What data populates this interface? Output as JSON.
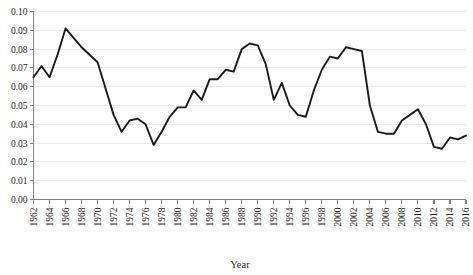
{
  "chart_data": {
    "type": "line",
    "title": "",
    "subtitle": "",
    "xlabel": "Year",
    "ylabel": "",
    "xlim": [
      1962,
      2016
    ],
    "ylim": [
      0.0,
      0.1
    ],
    "grid": "horizontal",
    "legend": "none",
    "y_ticks": [
      "0.00",
      "0.01",
      "0.02",
      "0.03",
      "0.04",
      "0.05",
      "0.06",
      "0.07",
      "0.08",
      "0.09",
      "0.10"
    ],
    "y_tick_values": [
      0.0,
      0.01,
      0.02,
      0.03,
      0.04,
      0.05,
      0.06,
      0.07,
      0.08,
      0.09,
      0.1
    ],
    "x_ticks": [
      "1962",
      "1964",
      "1966",
      "1968",
      "1970",
      "1972",
      "1974",
      "1976",
      "1978",
      "1980",
      "1982",
      "1984",
      "1986",
      "1988",
      "1990",
      "1992",
      "1994",
      "1996",
      "1998",
      "2000",
      "2002",
      "2004",
      "2006",
      "2008",
      "2010",
      "2012",
      "2014",
      "2016"
    ],
    "x_tick_values": [
      1962,
      1964,
      1966,
      1968,
      1970,
      1972,
      1974,
      1976,
      1978,
      1980,
      1982,
      1984,
      1986,
      1988,
      1990,
      1992,
      1994,
      1996,
      1998,
      2000,
      2002,
      2004,
      2006,
      2008,
      2010,
      2012,
      2014,
      2016
    ],
    "line_color": "#1a1a1a",
    "x": [
      1962,
      1963,
      1964,
      1965,
      1966,
      1967,
      1968,
      1969,
      1970,
      1971,
      1972,
      1973,
      1974,
      1975,
      1976,
      1977,
      1978,
      1979,
      1980,
      1981,
      1982,
      1983,
      1984,
      1985,
      1986,
      1987,
      1988,
      1989,
      1990,
      1991,
      1992,
      1993,
      1994,
      1995,
      1996,
      1997,
      1998,
      1999,
      2000,
      2001,
      2002,
      2003,
      2004,
      2005,
      2006,
      2007,
      2008,
      2009,
      2010,
      2011,
      2012,
      2013,
      2014,
      2015,
      2016
    ],
    "values": [
      0.065,
      0.071,
      0.065,
      0.077,
      0.091,
      0.086,
      0.081,
      0.077,
      0.073,
      0.059,
      0.045,
      0.036,
      0.042,
      0.043,
      0.04,
      0.029,
      0.036,
      0.044,
      0.049,
      0.049,
      0.058,
      0.053,
      0.064,
      0.064,
      0.069,
      0.068,
      0.08,
      0.083,
      0.082,
      0.072,
      0.053,
      0.062,
      0.05,
      0.045,
      0.044,
      0.058,
      0.069,
      0.076,
      0.075,
      0.081,
      0.08,
      0.079,
      0.05,
      0.036,
      0.035,
      0.035,
      0.042,
      0.045,
      0.048,
      0.04,
      0.028,
      0.027,
      0.033,
      0.032,
      0.034
    ],
    "series": [
      {
        "name": "",
        "values": [
          0.065,
          0.071,
          0.065,
          0.077,
          0.091,
          0.086,
          0.081,
          0.077,
          0.073,
          0.059,
          0.045,
          0.036,
          0.042,
          0.043,
          0.04,
          0.029,
          0.036,
          0.044,
          0.049,
          0.049,
          0.058,
          0.053,
          0.064,
          0.064,
          0.069,
          0.068,
          0.08,
          0.083,
          0.082,
          0.072,
          0.053,
          0.062,
          0.05,
          0.045,
          0.044,
          0.058,
          0.069,
          0.076,
          0.075,
          0.081,
          0.08,
          0.079,
          0.05,
          0.036,
          0.035,
          0.035,
          0.042,
          0.045,
          0.048,
          0.04,
          0.028,
          0.027,
          0.033,
          0.032,
          0.034
        ]
      }
    ]
  }
}
